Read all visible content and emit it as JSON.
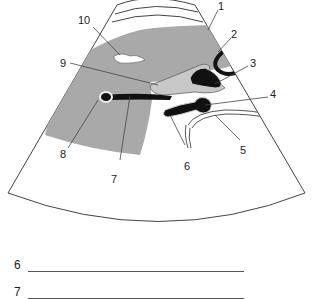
{
  "figure": {
    "type": "ultrasound-sector-schematic",
    "colors": {
      "tissue_gray": "#a9a9a9",
      "light_gray": "#c8c8c8",
      "black_structure": "#111111",
      "outline": "#444444",
      "background": "#ffffff"
    },
    "labels": [
      {
        "id": "1",
        "text": "1"
      },
      {
        "id": "2",
        "text": "2"
      },
      {
        "id": "3",
        "text": "3"
      },
      {
        "id": "4",
        "text": "4"
      },
      {
        "id": "5",
        "text": "5"
      },
      {
        "id": "6",
        "text": "6"
      },
      {
        "id": "7",
        "text": "7"
      },
      {
        "id": "8",
        "text": "8"
      },
      {
        "id": "9",
        "text": "9"
      },
      {
        "id": "10",
        "text": "10"
      }
    ]
  },
  "answer_lines": [
    {
      "number": "6",
      "value": ""
    },
    {
      "number": "7",
      "value": ""
    }
  ]
}
